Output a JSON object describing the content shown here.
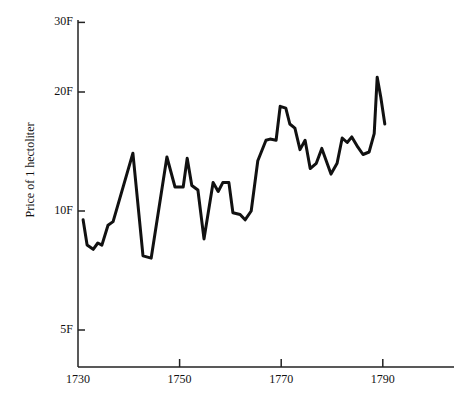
{
  "chart_data": {
    "type": "line",
    "title": "",
    "xlabel": "",
    "ylabel": "Price of 1 hectoliter",
    "xlim": [
      1730,
      1803
    ],
    "ylim": [
      3.8,
      33
    ],
    "yscale": "log",
    "grid": false,
    "legend": null,
    "xticks": [
      1730,
      1750,
      1770,
      1790
    ],
    "xtick_labels": [
      "1730",
      "1750",
      "1770",
      "1790"
    ],
    "yticks": [
      5,
      10,
      20,
      30
    ],
    "ytick_labels": [
      "5F",
      "10F",
      "20F",
      "30F"
    ],
    "series": [
      {
        "name": "Price of 1 hectoliter",
        "x": [
          1731.0,
          1731.8,
          1733.0,
          1733.9,
          1734.7,
          1735.9,
          1736.9,
          1740.8,
          1742.8,
          1744.4,
          1747.5,
          1749.1,
          1750.7,
          1751.5,
          1752.4,
          1753.6,
          1754.8,
          1756.6,
          1757.6,
          1758.5,
          1759.7,
          1760.5,
          1761.9,
          1762.9,
          1764.1,
          1765.4,
          1767.0,
          1767.8,
          1769.0,
          1769.8,
          1770.9,
          1771.7,
          1772.7,
          1773.7,
          1774.7,
          1775.7,
          1776.9,
          1778.0,
          1779.8,
          1781.0,
          1782.0,
          1783.0,
          1783.9,
          1785.1,
          1786.1,
          1787.3,
          1788.3,
          1788.9,
          1789.6,
          1790.4
        ],
        "values": [
          9.5,
          8.2,
          8.0,
          8.3,
          8.2,
          9.2,
          9.4,
          14.0,
          7.7,
          7.6,
          13.7,
          11.5,
          11.5,
          13.6,
          11.6,
          11.3,
          8.5,
          11.8,
          11.2,
          11.8,
          11.8,
          9.9,
          9.8,
          9.5,
          10.0,
          13.4,
          15.1,
          15.2,
          15.1,
          18.4,
          18.2,
          16.6,
          16.2,
          14.3,
          15.1,
          12.8,
          13.2,
          14.4,
          12.4,
          13.2,
          15.3,
          14.9,
          15.4,
          14.5,
          13.9,
          14.1,
          15.7,
          21.8,
          19.4,
          16.6
        ]
      }
    ]
  },
  "colors": {
    "line": "#111111",
    "axis": "#222222",
    "background": "#ffffff"
  }
}
